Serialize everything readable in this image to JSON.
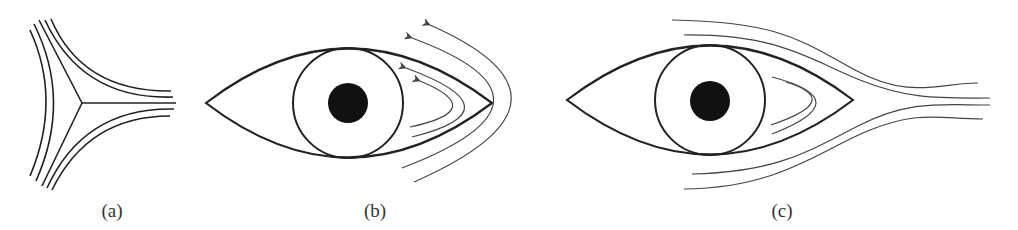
{
  "figure": {
    "panels": [
      {
        "id": "a",
        "label": "(a)",
        "description": "Three-way stagnation streamline junction"
      },
      {
        "id": "b",
        "label": "(b)",
        "description": "Eye shape with reversed flow arrows wrapping around right corner"
      },
      {
        "id": "c",
        "label": "(c)",
        "description": "Eye shape with streamlines passing around and converging to the right"
      }
    ],
    "colors": {
      "stroke": "#222222",
      "thin_stroke": "#444444",
      "pupil": "#111111",
      "background": "#ffffff"
    }
  }
}
